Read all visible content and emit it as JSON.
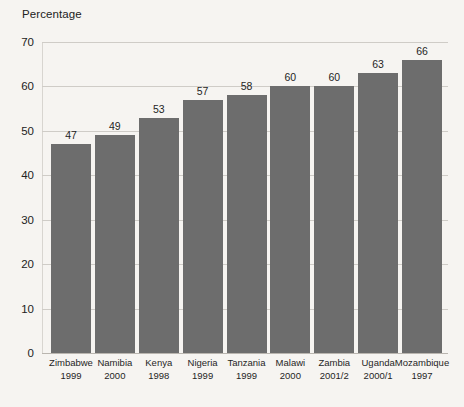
{
  "chart_data": {
    "type": "bar",
    "title": "",
    "subtitle": "",
    "xlabel": "",
    "ylabel": "Percentage",
    "ylim": [
      0,
      70
    ],
    "yticks": [
      0,
      10,
      20,
      30,
      40,
      50,
      60,
      70
    ],
    "grid": true,
    "legend": "none",
    "bar_color": "#6d6d6d",
    "background_color": "#f6f4f1",
    "gridline_color": "#cfccc7",
    "categories": [
      "Zimbabwe 1999",
      "Namibia 2000",
      "Kenya 1998",
      "Nigeria 1999",
      "Tanzania 1999",
      "Malawi 2000",
      "Zambia 2001/2",
      "Uganda 2000/1",
      "Mozambique 1997"
    ],
    "values": [
      47,
      49,
      53,
      57,
      58,
      60,
      60,
      63,
      66
    ],
    "points": [
      {
        "country": "Zimbabwe",
        "year": "1999",
        "value": 47,
        "label": "47"
      },
      {
        "country": "Namibia",
        "year": "2000",
        "value": 49,
        "label": "49"
      },
      {
        "country": "Kenya",
        "year": "1998",
        "value": 53,
        "label": "53"
      },
      {
        "country": "Nigeria",
        "year": "1999",
        "value": 57,
        "label": "57"
      },
      {
        "country": "Tanzania",
        "year": "1999",
        "value": 58,
        "label": "58"
      },
      {
        "country": "Malawi",
        "year": "2000",
        "value": 60,
        "label": "60"
      },
      {
        "country": "Zambia",
        "year": "2001/2",
        "value": 60,
        "label": "60"
      },
      {
        "country": "Uganda",
        "year": "2000/1",
        "value": 63,
        "label": "63"
      },
      {
        "country": "Mozambique",
        "year": "1997",
        "value": 66,
        "label": "66"
      }
    ]
  },
  "axis_title": "Percentage",
  "ytick_labels": [
    "70",
    "60",
    "50",
    "40",
    "30",
    "20",
    "10",
    "0"
  ]
}
